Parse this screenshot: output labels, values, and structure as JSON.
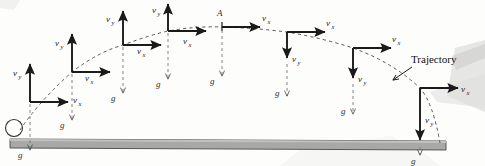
{
  "figure": {
    "background_color": "#fdfdfc",
    "ink_color": "#1a1a1a",
    "ground_fill": "#a8a8a8",
    "ground_stroke": "#4a4a4a"
  },
  "labels": {
    "vx": "v",
    "vx_sub": "x",
    "vy": "v",
    "vy_sub": "y",
    "g": "g",
    "apex_point": "A",
    "trajectory": "Trajectory"
  },
  "ball": {
    "name": "projectile-ball",
    "cx": 14,
    "cy": 128,
    "r": 8.5,
    "fill": "#ffffff",
    "stroke": "#333333"
  },
  "ground": {
    "name": "ground-bar",
    "x_left": 10,
    "x_right": 446,
    "y_left_top": 139,
    "y_right_top": 141,
    "thickness": 9
  },
  "trajectory_path": {
    "type": "parabola",
    "style": "dashed",
    "start": {
      "x": 20,
      "y": 130
    },
    "apex": {
      "x": 222,
      "y": 27
    },
    "end": {
      "x": 440,
      "y": 143
    }
  },
  "positions": [
    {
      "id": 1,
      "name": "position-1-launch",
      "origin": {
        "x": 30,
        "y": 102
      },
      "vy_dir": "up",
      "vy_len": 38,
      "vx_len": 38,
      "g_top": 116,
      "g_len": 34,
      "vy_label_x": 14,
      "vy_label_y": 72,
      "vx_label_x": 74,
      "vx_label_y": 100,
      "g_label_x": 19,
      "g_label_y": 155
    },
    {
      "id": 2,
      "name": "position-2-ascending",
      "origin": {
        "x": 72,
        "y": 72
      },
      "vy_dir": "up",
      "vy_len": 38,
      "vx_len": 38,
      "g_top": 86,
      "g_len": 34,
      "vy_label_x": 56,
      "vy_label_y": 43,
      "vx_label_x": 86,
      "vx_label_y": 78,
      "g_label_x": 61,
      "g_label_y": 125
    },
    {
      "id": 3,
      "name": "position-3-ascending",
      "origin": {
        "x": 123,
        "y": 45
      },
      "vy_dir": "up",
      "vy_len": 38,
      "vx_len": 38,
      "g_top": 59,
      "g_len": 34,
      "vy_label_x": 107,
      "vy_label_y": 18,
      "vx_label_x": 138,
      "vx_label_y": 56,
      "g_label_x": 112,
      "g_label_y": 98
    },
    {
      "id": 4,
      "name": "position-4-near-apex",
      "origin": {
        "x": 168,
        "y": 31
      },
      "vy_dir": "up",
      "vy_len": 32,
      "vx_len": 38,
      "g_top": 45,
      "g_len": 34,
      "vy_label_x": 153,
      "vy_label_y": 10,
      "vx_label_x": 184,
      "vx_label_y": 44,
      "g_label_x": 157,
      "g_label_y": 82
    },
    {
      "id": 5,
      "name": "position-5-apex",
      "origin": {
        "x": 222,
        "y": 27
      },
      "vy_dir": "none",
      "vy_len": 0,
      "vx_len": 38,
      "g_top": 41,
      "g_len": 34,
      "vy_label_x": 0,
      "vy_label_y": 0,
      "vx_label_x": 263,
      "vx_label_y": 18,
      "g_label_x": 211,
      "g_label_y": 75
    },
    {
      "id": 6,
      "name": "position-6-descending",
      "origin": {
        "x": 287,
        "y": 32
      },
      "vy_dir": "down",
      "vy_len": 26,
      "vx_len": 38,
      "g_top": 72,
      "g_len": 30,
      "vy_label_x": 293,
      "vy_label_y": 58,
      "vx_label_x": 327,
      "vx_label_y": 22,
      "g_label_x": 276,
      "g_label_y": 92
    },
    {
      "id": 7,
      "name": "position-7-descending",
      "origin": {
        "x": 353,
        "y": 48
      },
      "vy_dir": "down",
      "vy_len": 30,
      "vx_len": 38,
      "g_top": 92,
      "g_len": 28,
      "vy_label_x": 359,
      "vy_label_y": 76,
      "vx_label_x": 393,
      "vx_label_y": 38,
      "g_label_x": 342,
      "g_label_y": 110
    },
    {
      "id": 8,
      "name": "position-8-impact",
      "origin": {
        "x": 420,
        "y": 88
      },
      "vy_dir": "down",
      "vy_len": 52,
      "vx_len": 38,
      "g_top": 145,
      "g_len": 12,
      "vy_label_x": 426,
      "vy_label_y": 120,
      "vx_label_x": 462,
      "vx_label_y": 84,
      "g_label_x": 412,
      "g_label_y": 162
    }
  ],
  "annotation": {
    "name": "trajectory-callout",
    "text_x": 411,
    "text_y": 62,
    "leader_from": {
      "x": 410,
      "y": 65
    },
    "leader_to": {
      "x": 392,
      "y": 79
    }
  }
}
